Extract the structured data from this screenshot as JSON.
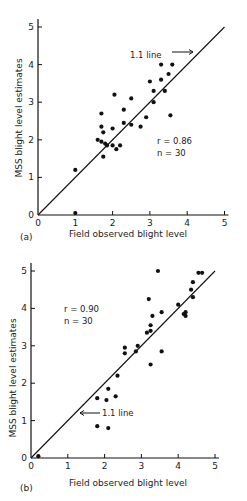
{
  "chart_data": [
    {
      "type": "scatter",
      "panel": "(a)",
      "xlabel": "Field observed blight level",
      "ylabel": "MSS blight level estimates",
      "xlim": [
        0,
        5
      ],
      "ylim": [
        0,
        5
      ],
      "xticks": [
        "0",
        "1",
        "2",
        "3",
        "4",
        "5"
      ],
      "yticks": [
        "0",
        "1",
        "2",
        "3",
        "4",
        "5"
      ],
      "grid": false,
      "reference_line": {
        "label": "1:1 line",
        "from": [
          0,
          0
        ],
        "to": [
          5,
          5
        ]
      },
      "stats": {
        "r": "r = 0.86",
        "n": "n = 30"
      },
      "points": [
        [
          1.0,
          1.2
        ],
        [
          1.0,
          0.05
        ],
        [
          1.6,
          2.0
        ],
        [
          1.7,
          2.7
        ],
        [
          1.7,
          2.35
        ],
        [
          1.75,
          2.2
        ],
        [
          1.7,
          1.95
        ],
        [
          1.75,
          1.55
        ],
        [
          1.8,
          1.9
        ],
        [
          1.85,
          1.85
        ],
        [
          2.0,
          1.85
        ],
        [
          2.0,
          2.3
        ],
        [
          2.05,
          3.2
        ],
        [
          2.1,
          1.75
        ],
        [
          2.2,
          1.85
        ],
        [
          2.3,
          2.8
        ],
        [
          2.3,
          2.45
        ],
        [
          2.5,
          2.4
        ],
        [
          2.5,
          3.1
        ],
        [
          2.75,
          2.35
        ],
        [
          2.9,
          2.6
        ],
        [
          3.0,
          3.55
        ],
        [
          3.1,
          3.3
        ],
        [
          3.1,
          3.0
        ],
        [
          3.3,
          3.6
        ],
        [
          3.3,
          4.0
        ],
        [
          3.4,
          3.3
        ],
        [
          3.5,
          3.75
        ],
        [
          3.6,
          4.0
        ],
        [
          3.55,
          2.65
        ]
      ]
    },
    {
      "type": "scatter",
      "panel": "(b)",
      "xlabel": "Field observed blight level",
      "ylabel": "MSS blight level estimates",
      "xlim": [
        0,
        5
      ],
      "ylim": [
        0,
        5
      ],
      "xticks": [
        "0",
        "1",
        "2",
        "3",
        "4",
        "5"
      ],
      "yticks": [
        "0",
        "1",
        "2",
        "3",
        "4",
        "5"
      ],
      "grid": false,
      "reference_line": {
        "label": "1:1 line",
        "from": [
          0,
          0
        ],
        "to": [
          5,
          5
        ]
      },
      "stats": {
        "r": "r = 0.90",
        "n": "n = 30"
      },
      "points": [
        [
          0.2,
          0.05
        ],
        [
          1.8,
          1.6
        ],
        [
          1.8,
          0.85
        ],
        [
          2.05,
          1.55
        ],
        [
          2.1,
          1.85
        ],
        [
          2.1,
          0.8
        ],
        [
          2.3,
          1.65
        ],
        [
          2.35,
          2.2
        ],
        [
          2.55,
          2.95
        ],
        [
          2.55,
          2.8
        ],
        [
          2.85,
          2.85
        ],
        [
          2.9,
          3.0
        ],
        [
          3.15,
          3.35
        ],
        [
          3.2,
          4.25
        ],
        [
          3.25,
          2.5
        ],
        [
          3.25,
          3.55
        ],
        [
          3.25,
          3.4
        ],
        [
          3.3,
          3.8
        ],
        [
          3.45,
          5.0
        ],
        [
          3.55,
          3.9
        ],
        [
          3.55,
          2.85
        ],
        [
          4.0,
          4.1
        ],
        [
          4.15,
          3.85
        ],
        [
          4.2,
          3.9
        ],
        [
          4.35,
          4.5
        ],
        [
          4.4,
          4.3
        ],
        [
          4.4,
          4.7
        ],
        [
          4.55,
          4.95
        ],
        [
          4.65,
          4.95
        ],
        [
          4.2,
          3.8
        ]
      ]
    }
  ],
  "panels": {
    "a": {
      "tag": "(a)",
      "xlabel": "Field observed blight level",
      "ylabel": "MSS blight level estimates",
      "ref_label": "1.1 line",
      "r_text": "r = 0.86",
      "n_text": "n = 30",
      "ticks": [
        "0",
        "1",
        "2",
        "3",
        "4",
        "5"
      ]
    },
    "b": {
      "tag": "(b)",
      "xlabel": "Field observed blight level",
      "ylabel": "MSS blight level estimates",
      "ref_label": "1.1 line",
      "r_text": "r = 0.90",
      "n_text": "n = 30",
      "ticks": [
        "0",
        "1",
        "2",
        "3",
        "4",
        "5"
      ]
    }
  }
}
